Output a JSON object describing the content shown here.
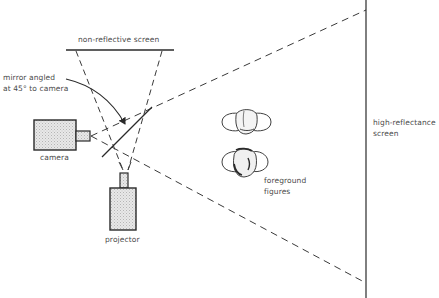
{
  "diagram": {
    "type": "optical-setup",
    "colors": {
      "line": "#2a2a2a",
      "fill": "#e3e3e3",
      "text": "#4a4a4a",
      "background": "#ffffff"
    },
    "labels": {
      "non_reflective_screen": "non-reflective screen",
      "mirror_line1": "mirror angled",
      "mirror_line2": "at 45° to camera",
      "camera": "camera",
      "projector": "projector",
      "foreground_line1": "foreground",
      "foreground_line2": "figures",
      "high_reflectance_line1": "high-reflectance",
      "high_reflectance_line2": "screen"
    },
    "components": [
      {
        "id": "non-reflective-screen",
        "kind": "screen",
        "label": "non-reflective screen"
      },
      {
        "id": "mirror",
        "kind": "mirror",
        "label": "mirror angled at 45° to camera"
      },
      {
        "id": "camera",
        "kind": "device",
        "label": "camera"
      },
      {
        "id": "projector",
        "kind": "device",
        "label": "projector"
      },
      {
        "id": "foreground-figures",
        "kind": "subjects",
        "label": "foreground figures"
      },
      {
        "id": "high-reflectance-screen",
        "kind": "screen",
        "label": "high-reflectance screen"
      }
    ]
  }
}
